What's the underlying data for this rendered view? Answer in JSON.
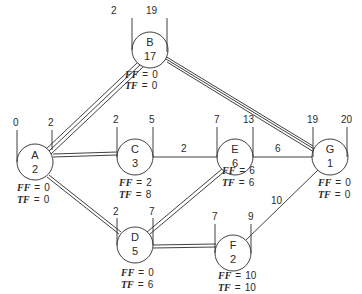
{
  "diagram": {
    "type": "activity-on-node network (critical path)",
    "nodes": [
      {
        "id": "A",
        "duration": "2",
        "es": "0",
        "lf": "2",
        "ff": "0",
        "tf": "0"
      },
      {
        "id": "B",
        "duration": "17",
        "es": "2",
        "lf": "19",
        "ff": "0",
        "tf": "0"
      },
      {
        "id": "C",
        "duration": "3",
        "es": "2",
        "lf": "5",
        "ff": "2",
        "tf": "8"
      },
      {
        "id": "D",
        "duration": "5",
        "es": "2",
        "lf": "7",
        "ff": "0",
        "tf": "6"
      },
      {
        "id": "E",
        "duration": "6",
        "es": "7",
        "lf": "13",
        "ff": "6",
        "tf": "6"
      },
      {
        "id": "F",
        "duration": "2",
        "es": "7",
        "lf": "9",
        "ff": "10",
        "tf": "10"
      },
      {
        "id": "G",
        "duration": "1",
        "es": "19",
        "lf": "20",
        "ff": "0",
        "tf": "0"
      }
    ],
    "edges": [
      {
        "from": "A",
        "to": "B",
        "style": "triple"
      },
      {
        "from": "B",
        "to": "G",
        "style": "triple"
      },
      {
        "from": "A",
        "to": "C",
        "style": "double"
      },
      {
        "from": "A",
        "to": "D",
        "style": "double"
      },
      {
        "from": "D",
        "to": "E",
        "style": "double"
      },
      {
        "from": "D",
        "to": "F",
        "style": "double"
      },
      {
        "from": "C",
        "to": "E",
        "style": "single",
        "label": "2"
      },
      {
        "from": "E",
        "to": "G",
        "style": "single",
        "label": "6"
      },
      {
        "from": "F",
        "to": "G",
        "style": "single",
        "label": "10"
      }
    ],
    "ff_label": "FF",
    "tf_label": "TF",
    "equals": "="
  }
}
